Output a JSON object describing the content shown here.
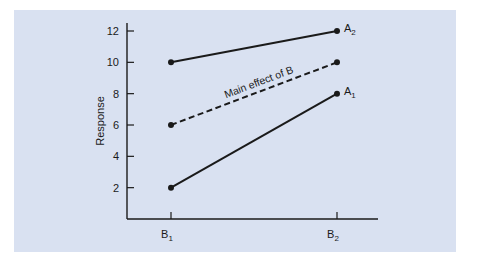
{
  "chart_data": {
    "type": "line",
    "title": "",
    "xlabel": "",
    "ylabel": "Response",
    "categories": [
      "B1",
      "B2"
    ],
    "category_labels": [
      {
        "main": "B",
        "sub": "1"
      },
      {
        "main": "B",
        "sub": "2"
      }
    ],
    "ylim": [
      0,
      12
    ],
    "yticks": [
      2,
      4,
      6,
      8,
      10,
      12
    ],
    "grid": false,
    "legend": "none (series labeled at line ends)",
    "series": [
      {
        "name": "A2",
        "label_main": "A",
        "label_sub": "2",
        "values": [
          10,
          12
        ],
        "style": "solid"
      },
      {
        "name": "Main effect of B",
        "values": [
          6,
          10
        ],
        "style": "dashed"
      },
      {
        "name": "A1",
        "label_main": "A",
        "label_sub": "1",
        "values": [
          2,
          8
        ],
        "style": "solid"
      }
    ],
    "annotations": [
      {
        "text": "Main effect of B",
        "along_series": "Main effect of B"
      }
    ]
  },
  "colors": {
    "panel_background": "#d9e1f1",
    "line": "#1a1a1a"
  }
}
